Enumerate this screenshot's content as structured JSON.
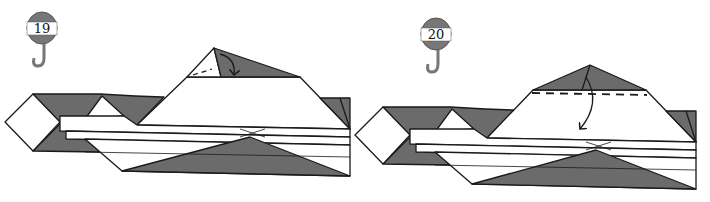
{
  "diagram": {
    "colors": {
      "paper_back": "#6b6b6b",
      "paper_front": "#ffffff",
      "line": "#1a1a1a",
      "badge_gray": "#777777"
    },
    "steps": [
      {
        "number": "19",
        "fold_type": "valley fold",
        "action": "fold small flap down along dashed line"
      },
      {
        "number": "20",
        "fold_type": "valley fold",
        "action": "fold top triangle down along dashed line"
      }
    ]
  }
}
